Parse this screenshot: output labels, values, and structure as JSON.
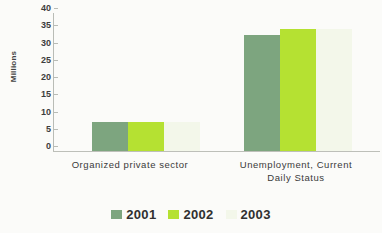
{
  "chart_data": {
    "type": "bar",
    "title": "",
    "xlabel": "",
    "ylabel": "Millions",
    "ylim": [
      0,
      40
    ],
    "yticks": [
      0,
      5,
      10,
      15,
      20,
      25,
      30,
      35,
      40
    ],
    "grid": false,
    "legend_position": "bottom",
    "categories": [
      "Organized private sector",
      "Unemployment, Current Daily Status"
    ],
    "category_lines": [
      [
        "Organized private sector"
      ],
      [
        "Unemployment, Current",
        "Daily Status"
      ]
    ],
    "series": [
      {
        "name": "2001",
        "color": "#7da57f",
        "values": [
          8.4,
          33.5
        ]
      },
      {
        "name": "2002",
        "color": "#b5e132",
        "values": [
          8.3,
          35.3
        ]
      },
      {
        "name": "2003",
        "color": "#f3f7ea",
        "values": [
          8.3,
          35.4
        ]
      }
    ]
  }
}
